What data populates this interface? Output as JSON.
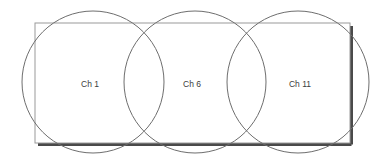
{
  "diagram": {
    "background_color": "#ffffff",
    "room": {
      "name": "coverage-area-rectangle",
      "x": 35,
      "y": 23,
      "width": 315,
      "height": 120,
      "fill_color": "#ffffff",
      "stroke_color": "#9a9a9a",
      "stroke_width": 1,
      "shadow_color": "#4a4a4a",
      "shadow_width": 3,
      "shadow_offset_x": 3,
      "shadow_offset_y": 3
    },
    "circle_style": {
      "stroke_color": "#6e6e6e",
      "stroke_width": 1,
      "fill": "none",
      "radius": 71,
      "center_y": 82
    },
    "label_style": {
      "color": "#3c3c3c",
      "font_size": "8.5px"
    },
    "channels": [
      {
        "id": "ch-1",
        "label": "Ch 1",
        "center_x": 93,
        "center_y": 82,
        "radius": 71,
        "label_x": 90,
        "label_y": 85
      },
      {
        "id": "ch-6",
        "label": "Ch 6",
        "center_x": 195,
        "center_y": 82,
        "radius": 71,
        "label_x": 192,
        "label_y": 85
      },
      {
        "id": "ch-11",
        "label": "Ch 11",
        "center_x": 298,
        "center_y": 82,
        "radius": 71,
        "label_x": 300,
        "label_y": 85
      }
    ]
  }
}
